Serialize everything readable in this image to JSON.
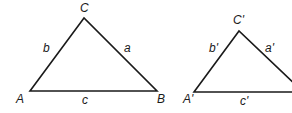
{
  "diagram": {
    "triangle_1": {
      "vertices": {
        "A": "A",
        "B": "B",
        "C": "C"
      },
      "sides": {
        "a": "a",
        "b": "b",
        "c": "c"
      }
    },
    "triangle_2": {
      "vertices": {
        "A": "A'",
        "C": "C'"
      },
      "sides": {
        "a": "a'",
        "b": "b'",
        "c": "c'"
      }
    },
    "stroke_color": "#1a1a1a"
  }
}
